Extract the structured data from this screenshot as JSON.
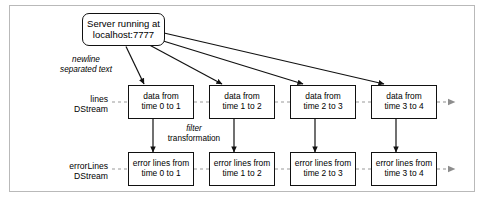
{
  "figure": {
    "kind": "dstream-flow-diagram",
    "frame_color": "#b9b9b9",
    "stroke_color": "#111111",
    "continuation_color": "#8d8d8d",
    "background": "#ffffff"
  },
  "source": {
    "name": "server-node",
    "line1": "Server running at",
    "line2": "localhost:7777"
  },
  "edge_labels": {
    "source_to_lines": {
      "italic_part": "newline",
      "plain_part": "separated text"
    },
    "lines_to_errorlines": {
      "italic_part": "filter",
      "plain_part": "transformation"
    }
  },
  "rows": [
    {
      "id": "lines-row",
      "label_line1": "lines",
      "label_line2": "DStream",
      "cells": [
        {
          "line1": "data from",
          "line2": "time 0 to 1"
        },
        {
          "line1": "data from",
          "line2": "time 1 to 2"
        },
        {
          "line1": "data from",
          "line2": "time 2 to 3"
        },
        {
          "line1": "data from",
          "line2": "time 3 to 4"
        }
      ]
    },
    {
      "id": "errorlines-row",
      "label_line1": "errorLines",
      "label_line2": "DStream",
      "cells": [
        {
          "line1": "error lines from",
          "line2": "time 0 to 1"
        },
        {
          "line1": "error lines from",
          "line2": "time 1 to 2"
        },
        {
          "line1": "error lines from",
          "line2": "time 2 to 3"
        },
        {
          "line1": "error lines from",
          "line2": "time 3 to 4"
        }
      ]
    }
  ]
}
